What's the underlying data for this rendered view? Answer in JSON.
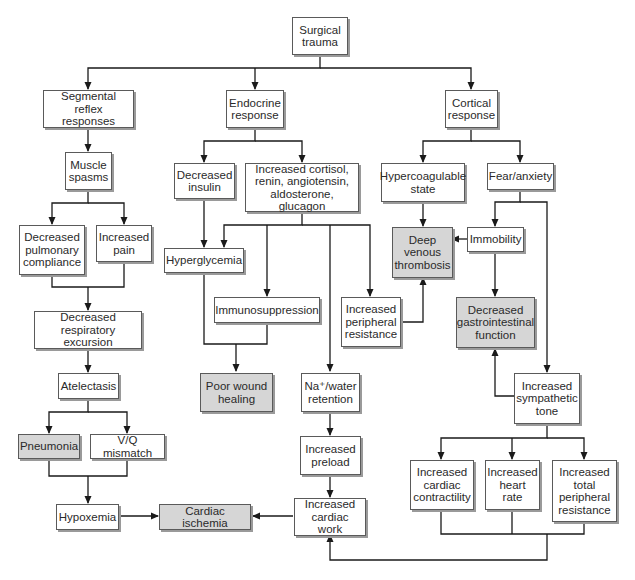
{
  "diagram": {
    "type": "flowchart",
    "colors": {
      "box_fill": "#ffffff",
      "highlight_fill": "#d6d6d6",
      "border": "#5a5a5a",
      "line": "#1a1a1a",
      "shadow": "#9a9a9a"
    },
    "nodes": {
      "surgical_trauma": "Surgical\ntrauma",
      "segmental_reflex": "Segmental reflex\nresponses",
      "endocrine_response": "Endocrine\nresponse",
      "cortical_response": "Cortical\nresponse",
      "muscle_spasms": "Muscle\nspasms",
      "decreased_insulin": "Decreased\ninsulin",
      "increased_hormones": "Increased cortisol,\nrenin, angiotensin,\naldosterone, glucagon",
      "hypercoagulable": "Hypercoagulable\nstate",
      "fear_anxiety": "Fear/anxiety",
      "decreased_pulmonary_compliance": "Decreased\npulmonary\ncompliance",
      "increased_pain": "Increased\npain",
      "hyperglycemia": "Hyperglycemia",
      "deep_venous_thrombosis": "Deep\nvenous\nthrombosis",
      "immobility": "Immobility",
      "immunosuppression": "Immunosuppression",
      "increased_peripheral_resistance": "Increased\nperipheral\nresistance",
      "decreased_gi_function": "Decreased\ngastrointestinal\nfunction",
      "decreased_respiratory_excursion": "Decreased\nrespiratory excursion",
      "atelectasis": "Atelectasis",
      "poor_wound_healing": "Poor wound\nhealing",
      "na_water_retention": "Na⁺/water\nretention",
      "increased_sympathetic_tone": "Increased\nsympathetic\ntone",
      "pneumonia": "Pneumonia",
      "vq_mismatch": "V/Q mismatch",
      "increased_preload": "Increased\npreload",
      "increased_cardiac_contractility": "Increased\ncardiac\ncontractility",
      "increased_heart_rate": "Increased\nheart\nrate",
      "increased_total_peripheral_resistance": "Increased\ntotal\nperipheral\nresistance",
      "hypoxemia": "Hypoxemia",
      "cardiac_ischemia": "Cardiac ischemia",
      "increased_cardiac_work": "Increased\ncardiac work"
    },
    "highlighted": [
      "deep_venous_thrombosis",
      "decreased_gi_function",
      "poor_wound_healing",
      "pneumonia",
      "cardiac_ischemia"
    ],
    "edges": [
      [
        "surgical_trauma",
        "segmental_reflex"
      ],
      [
        "surgical_trauma",
        "endocrine_response"
      ],
      [
        "surgical_trauma",
        "cortical_response"
      ],
      [
        "segmental_reflex",
        "muscle_spasms"
      ],
      [
        "muscle_spasms",
        "decreased_pulmonary_compliance"
      ],
      [
        "muscle_spasms",
        "increased_pain"
      ],
      [
        "decreased_pulmonary_compliance",
        "decreased_respiratory_excursion"
      ],
      [
        "increased_pain",
        "decreased_respiratory_excursion"
      ],
      [
        "decreased_respiratory_excursion",
        "atelectasis"
      ],
      [
        "atelectasis",
        "pneumonia"
      ],
      [
        "atelectasis",
        "vq_mismatch"
      ],
      [
        "pneumonia",
        "hypoxemia"
      ],
      [
        "vq_mismatch",
        "hypoxemia"
      ],
      [
        "hypoxemia",
        "cardiac_ischemia"
      ],
      [
        "endocrine_response",
        "decreased_insulin"
      ],
      [
        "endocrine_response",
        "increased_hormones"
      ],
      [
        "decreased_insulin",
        "hyperglycemia"
      ],
      [
        "increased_hormones",
        "hyperglycemia"
      ],
      [
        "increased_hormones",
        "immunosuppression"
      ],
      [
        "increased_hormones",
        "na_water_retention"
      ],
      [
        "increased_hormones",
        "increased_peripheral_resistance"
      ],
      [
        "hyperglycemia",
        "poor_wound_healing"
      ],
      [
        "immunosuppression",
        "poor_wound_healing"
      ],
      [
        "increased_peripheral_resistance",
        "deep_venous_thrombosis"
      ],
      [
        "na_water_retention",
        "increased_preload"
      ],
      [
        "increased_preload",
        "increased_cardiac_work"
      ],
      [
        "increased_cardiac_work",
        "cardiac_ischemia"
      ],
      [
        "cortical_response",
        "hypercoagulable"
      ],
      [
        "cortical_response",
        "fear_anxiety"
      ],
      [
        "hypercoagulable",
        "deep_venous_thrombosis"
      ],
      [
        "fear_anxiety",
        "immobility"
      ],
      [
        "fear_anxiety",
        "increased_sympathetic_tone"
      ],
      [
        "immobility",
        "deep_venous_thrombosis"
      ],
      [
        "immobility",
        "decreased_gi_function"
      ],
      [
        "increased_sympathetic_tone",
        "decreased_gi_function"
      ],
      [
        "increased_sympathetic_tone",
        "increased_cardiac_contractility"
      ],
      [
        "increased_sympathetic_tone",
        "increased_heart_rate"
      ],
      [
        "increased_sympathetic_tone",
        "increased_total_peripheral_resistance"
      ],
      [
        "increased_cardiac_contractility",
        "increased_cardiac_work"
      ],
      [
        "increased_heart_rate",
        "increased_cardiac_work"
      ],
      [
        "increased_total_peripheral_resistance",
        "increased_cardiac_work"
      ]
    ]
  }
}
